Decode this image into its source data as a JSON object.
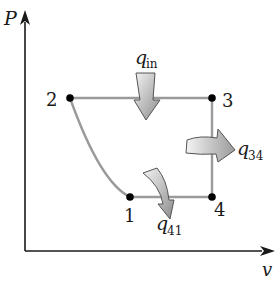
{
  "diagram": {
    "type": "P-v process diagram (thermodynamic cycle)",
    "axes": {
      "y_label": "P",
      "x_label": "v"
    },
    "states": [
      {
        "id": "1",
        "label": "1"
      },
      {
        "id": "2",
        "label": "2"
      },
      {
        "id": "3",
        "label": "3"
      },
      {
        "id": "4",
        "label": "4"
      }
    ],
    "processes": [
      {
        "from": "1",
        "to": "2",
        "shape": "curve"
      },
      {
        "from": "2",
        "to": "3",
        "shape": "horizontal line (constant pressure)"
      },
      {
        "from": "3",
        "to": "4",
        "shape": "vertical line (constant volume)"
      },
      {
        "from": "4",
        "to": "1",
        "shape": "horizontal line (constant pressure)"
      }
    ],
    "heat_transfers": [
      {
        "symbol": "q",
        "subscript": "in",
        "direction": "into system",
        "process": "2-3"
      },
      {
        "symbol": "q",
        "subscript": "34",
        "direction": "out of system",
        "process": "3-4"
      },
      {
        "symbol": "q",
        "subscript": "41",
        "direction": "out of system",
        "process": "4-1"
      }
    ],
    "colors": {
      "axis": "#1a1a1a",
      "process_line": "#9a9a9a",
      "state_point": "#000000",
      "arrow_fill_light": "#f2f2f2",
      "arrow_fill_dark": "#8c8c8c",
      "arrow_stroke": "#555555"
    }
  }
}
